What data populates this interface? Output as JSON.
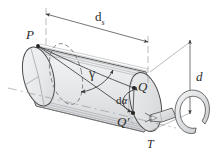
{
  "figure": {
    "type": "engineering-line-drawing",
    "background_color": "#ffffff",
    "line_color": "#3a3a3a",
    "body_fill": "#e8e9ea",
    "shade_fill": "#c9cbcd"
  },
  "labels": {
    "lead": "d",
    "lead_sub": "s",
    "diameter": "d",
    "point_p": "P",
    "point_q": "Q",
    "point_q_prime": "Q′",
    "angle_increment_d": "d",
    "angle_increment_alpha": "α",
    "helix_angle": "γ",
    "torque": "T"
  },
  "dimensions": {
    "lead_label": "d_s",
    "diameter_label": "d",
    "helix_angle_label": "gamma",
    "arc_angle_label": "d alpha"
  },
  "icons": {
    "torque_arrow": "curved-torque-arrow",
    "dimension_arrow": "double-headed-arrow",
    "pointer_arrow": "solid-cone-arrow"
  }
}
